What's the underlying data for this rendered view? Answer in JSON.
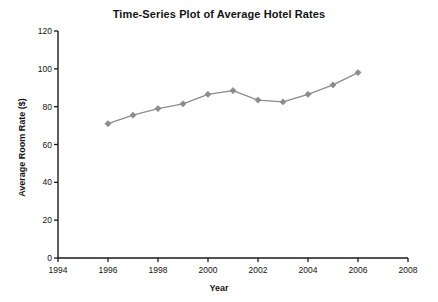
{
  "chart_data": {
    "type": "line",
    "title": "Time-Series Plot of Average Hotel Rates",
    "xlabel": "Year",
    "ylabel": "Average Room Rate ($)",
    "x": [
      1996,
      1997,
      1998,
      1999,
      2000,
      2001,
      2002,
      2003,
      2004,
      2005,
      2006
    ],
    "values": [
      71,
      75.5,
      79,
      81.5,
      86.5,
      88.5,
      83.5,
      82.5,
      86.5,
      91.5,
      98
    ],
    "series": [
      {
        "name": "Average Room Rate",
        "values": [
          71,
          75.5,
          79,
          81.5,
          86.5,
          88.5,
          83.5,
          82.5,
          86.5,
          91.5,
          98
        ]
      }
    ],
    "xlim": [
      1994,
      2008
    ],
    "ylim": [
      0,
      120
    ],
    "xticks": [
      "1994",
      "1996",
      "1998",
      "2000",
      "2002",
      "2004",
      "2006",
      "2008"
    ],
    "xtick_values": [
      1994,
      1996,
      1998,
      2000,
      2002,
      2004,
      2006,
      2008
    ],
    "yticks": [
      "0",
      "20",
      "40",
      "60",
      "80",
      "100",
      "120"
    ],
    "ytick_values": [
      0,
      20,
      40,
      60,
      80,
      100,
      120
    ],
    "grid": false,
    "legend": "none",
    "marker": "diamond",
    "line_color": "#8c8c8c",
    "marker_color": "#8c8c8c",
    "axis_color": "#1a1a1a",
    "background": "#ffffff"
  }
}
